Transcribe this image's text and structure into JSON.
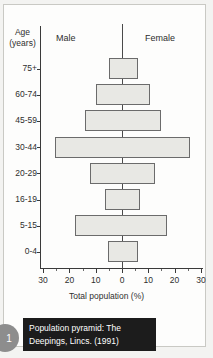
{
  "headers": {
    "age_label_line1": "Age",
    "age_label_line2": "(years)",
    "male": "Male",
    "female": "Female"
  },
  "caption": {
    "line1": "Population pyramid: The",
    "line2": "Deepings, Lincs. (1991)",
    "badge": "1"
  },
  "colors": {
    "bar_fill": "#e8e8e4",
    "bar_stroke": "#6b6b6b",
    "axis": "#3a3a3a",
    "caption_bg": "#1c1c1c",
    "badge_bg": "#8d8d8d",
    "page_bg": "#fdfdfc"
  },
  "chart_data": {
    "type": "bar",
    "subtype": "population-pyramid",
    "title": "Population pyramid: The Deepings, Lincs. (1991)",
    "xlabel": "Total population (%)",
    "ylabel": "Age (years)",
    "categories": [
      "75+",
      "60-74",
      "45-59",
      "30-44",
      "20-29",
      "16-19",
      "5-15",
      "0-4"
    ],
    "series": [
      {
        "name": "Male",
        "values": [
          5,
          10,
          14,
          25.5,
          12,
          6.5,
          18,
          5.5
        ]
      },
      {
        "name": "Female",
        "values": [
          6,
          10.5,
          15,
          26,
          12.5,
          7,
          17,
          6
        ]
      }
    ],
    "xlim": [
      -30,
      30
    ],
    "x_ticks": [
      30,
      20,
      10,
      0,
      10,
      20,
      30
    ],
    "x_tick_values": [
      -30,
      -20,
      -10,
      0,
      10,
      20,
      30
    ],
    "x_minor_step": 5,
    "grid": false,
    "legend": "none"
  }
}
